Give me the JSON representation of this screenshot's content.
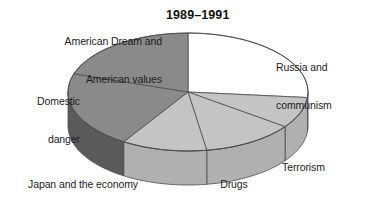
{
  "chart_data": {
    "type": "pie",
    "title": "1989–1991",
    "subtitle": "",
    "xlabel": "",
    "ylabel": "",
    "legend_position": "none",
    "grid": false,
    "style": "3d-pie",
    "categories": [
      "Russia and communism",
      "Terrorism",
      "Drugs",
      "Japan and the economy",
      "Domestic danger",
      "American Dream and American values"
    ],
    "values": [
      26.5,
      8.5,
      12.5,
      11.5,
      21.0,
      20.0
    ],
    "units": "percent",
    "slices": [
      {
        "label": "Russia and communism",
        "label_lines": [
          "Russia and",
          "communism"
        ],
        "value": 26.5,
        "start_angle": 0,
        "end_angle": 95.4,
        "color": "#ffffff",
        "side_color": "#c9c9c9",
        "label_align": "left"
      },
      {
        "label": "Terrorism",
        "label_lines": [
          "Terrorism"
        ],
        "value": 8.5,
        "start_angle": 95.4,
        "end_angle": 126.0,
        "color": "#c4c4c4",
        "side_color": "#b0b0b0",
        "label_align": "left"
      },
      {
        "label": "Drugs",
        "label_lines": [
          "Drugs"
        ],
        "value": 12.5,
        "start_angle": 126.0,
        "end_angle": 171.0,
        "color": "#c4c4c4",
        "side_color": "#b0b0b0",
        "label_align": "center"
      },
      {
        "label": "Japan and the economy",
        "label_lines": [
          "Japan and the economy"
        ],
        "value": 11.5,
        "start_angle": 171.0,
        "end_angle": 212.4,
        "color": "#c4c4c4",
        "side_color": "#b0b0b0",
        "label_align": "left"
      },
      {
        "label": "Domestic danger",
        "label_lines": [
          "Domestic",
          "danger"
        ],
        "value": 21.0,
        "start_angle": 212.4,
        "end_angle": 288.0,
        "color": "#8a8a8a",
        "side_color": "#5a5a5a",
        "label_align": "right"
      },
      {
        "label": "American Dream and American values",
        "label_lines": [
          "American Dream and",
          "American values"
        ],
        "value": 20.0,
        "start_angle": 288.0,
        "end_angle": 360.0,
        "color": "#8a8a8a",
        "side_color": "#6e6e6e",
        "label_align": "right"
      }
    ],
    "geometry": {
      "cx": 188,
      "cy": 92,
      "rx": 120,
      "ry": 59,
      "depth": 34
    },
    "colors": {
      "white_slice": "#ffffff",
      "light_gray_slice": "#c4c4c4",
      "mid_gray_slice": "#8a8a8a",
      "dark_side": "#5a5a5a",
      "outline": "#4d4d4d",
      "text": "#1c1c1c",
      "background": "#ffffff"
    }
  },
  "labels": {
    "title": "1989–1991",
    "american_dream_line1": "American Dream and",
    "american_dream_line2": "American values",
    "russia_line1": "Russia and",
    "russia_line2": "communism",
    "domestic_line1": "Domestic",
    "domestic_line2": "danger",
    "terrorism": "Terrorism",
    "drugs": "Drugs",
    "japan": "Japan and the economy"
  }
}
